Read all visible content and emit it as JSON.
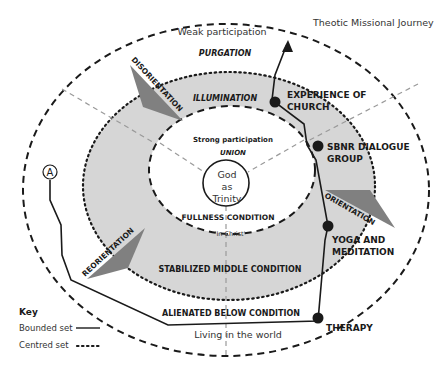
{
  "title": "Theotic Missional Journey",
  "zones": {
    "outer_top": "Weak participation",
    "outer_stage": "PURGATION",
    "middle_stage": "ILLUMINATION",
    "inner_top": "Strong participation",
    "inner_stage": "UNION",
    "center_line1": "God",
    "center_line2": "as",
    "center_line3": "Trinity",
    "inner_condition": "FULLNESS CONDITION",
    "inner_bottom": "'In Christ'",
    "middle_condition": "STABILIZED MIDDLE CONDITION",
    "outer_condition": "ALIENATED BELOW CONDITION",
    "outer_bottom": "Living in the world"
  },
  "transitions": {
    "disorientation": "DISORIENTATION",
    "orientation": "ORIENTATION",
    "reorientation": "REORIENTATION"
  },
  "journey": {
    "start_marker": "A",
    "points": [
      {
        "label_line1": "THERAPY",
        "label_line2": ""
      },
      {
        "label_line1": "YOGA AND",
        "label_line2": "MEDITATION"
      },
      {
        "label_line1": "SBNR DIALOGUE",
        "label_line2": "GROUP"
      },
      {
        "label_line1": "EXPERIENCE OF",
        "label_line2": "CHURCH"
      }
    ]
  },
  "key": {
    "title": "Key",
    "bounded": "Bounded set",
    "centred": "Centred set"
  },
  "colors": {
    "middle_fill": "#d6d6d6",
    "arrow_fill": "#808080",
    "line": "#1a1a1a",
    "radial": "#9a9a9a"
  }
}
